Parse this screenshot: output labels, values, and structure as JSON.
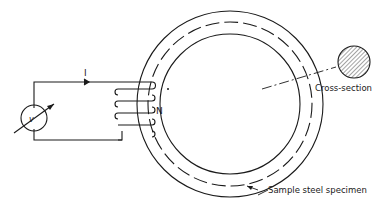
{
  "diagram": {
    "current_label": "I",
    "turns_label": "N",
    "meter_label": "v",
    "cross_section_label": "Cross-section",
    "specimen_label": "Sample steel specimen"
  },
  "colors": {
    "line": "#1a1a1a",
    "background": "#ffffff"
  }
}
